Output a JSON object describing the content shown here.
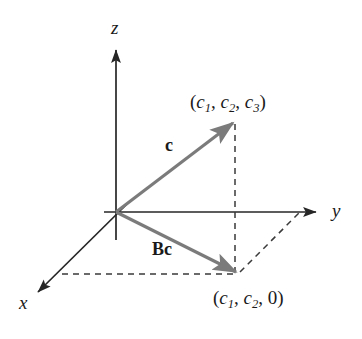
{
  "figure": {
    "type": "vector-diagram-3d",
    "background_color": "#ffffff",
    "axis_color": "#262626",
    "vector_color": "#7b7b7b",
    "dash_color": "#3a3a3a",
    "text_color": "#1a1a1a",
    "axes": [
      {
        "name": "z",
        "label": "z",
        "direction": "up"
      },
      {
        "name": "y",
        "label": "y",
        "direction": "right"
      },
      {
        "name": "x",
        "label": "x",
        "direction": "down-left"
      }
    ],
    "vectors": [
      {
        "name": "c",
        "label": "c",
        "from": "origin",
        "to": "(c1, c2, c3)"
      },
      {
        "name": "Bc",
        "label": "Bc",
        "from": "origin",
        "to": "(c1, c2, 0)"
      }
    ],
    "points": [
      {
        "name": "point-3d",
        "label_parts": {
          "open": "(",
          "c": "c",
          "s1": "1",
          "sep1": ", ",
          "s2": "2",
          "sep2": ", ",
          "s3": "3",
          "close": ")"
        },
        "label_text": "(c1, c2, c3)"
      },
      {
        "name": "point-projection",
        "label_parts": {
          "open": "(",
          "c": "c",
          "s1": "1",
          "sep1": ", ",
          "s2": "2",
          "sep2": ", ",
          "zero": "0",
          "close": ")"
        },
        "label_text": "(c1, c2, 0)"
      }
    ],
    "labels": {
      "axis_z": "z",
      "axis_y": "y",
      "axis_x": "x",
      "vector_c": "c",
      "vector_bc": "Bc",
      "point_3d_open": "(",
      "point_3d_c1": "c",
      "point_3d_sub1": "1",
      "point_3d_comma1": ", ",
      "point_3d_c2": "c",
      "point_3d_sub2": "2",
      "point_3d_comma2": ", ",
      "point_3d_c3": "c",
      "point_3d_sub3": "3",
      "point_3d_close": ")",
      "point_proj_open": "(",
      "point_proj_c1": "c",
      "point_proj_sub1": "1",
      "point_proj_comma1": ", ",
      "point_proj_c2": "c",
      "point_proj_sub2": "2",
      "point_proj_comma2": ", ",
      "point_proj_zero": "0",
      "point_proj_close": ")"
    }
  }
}
